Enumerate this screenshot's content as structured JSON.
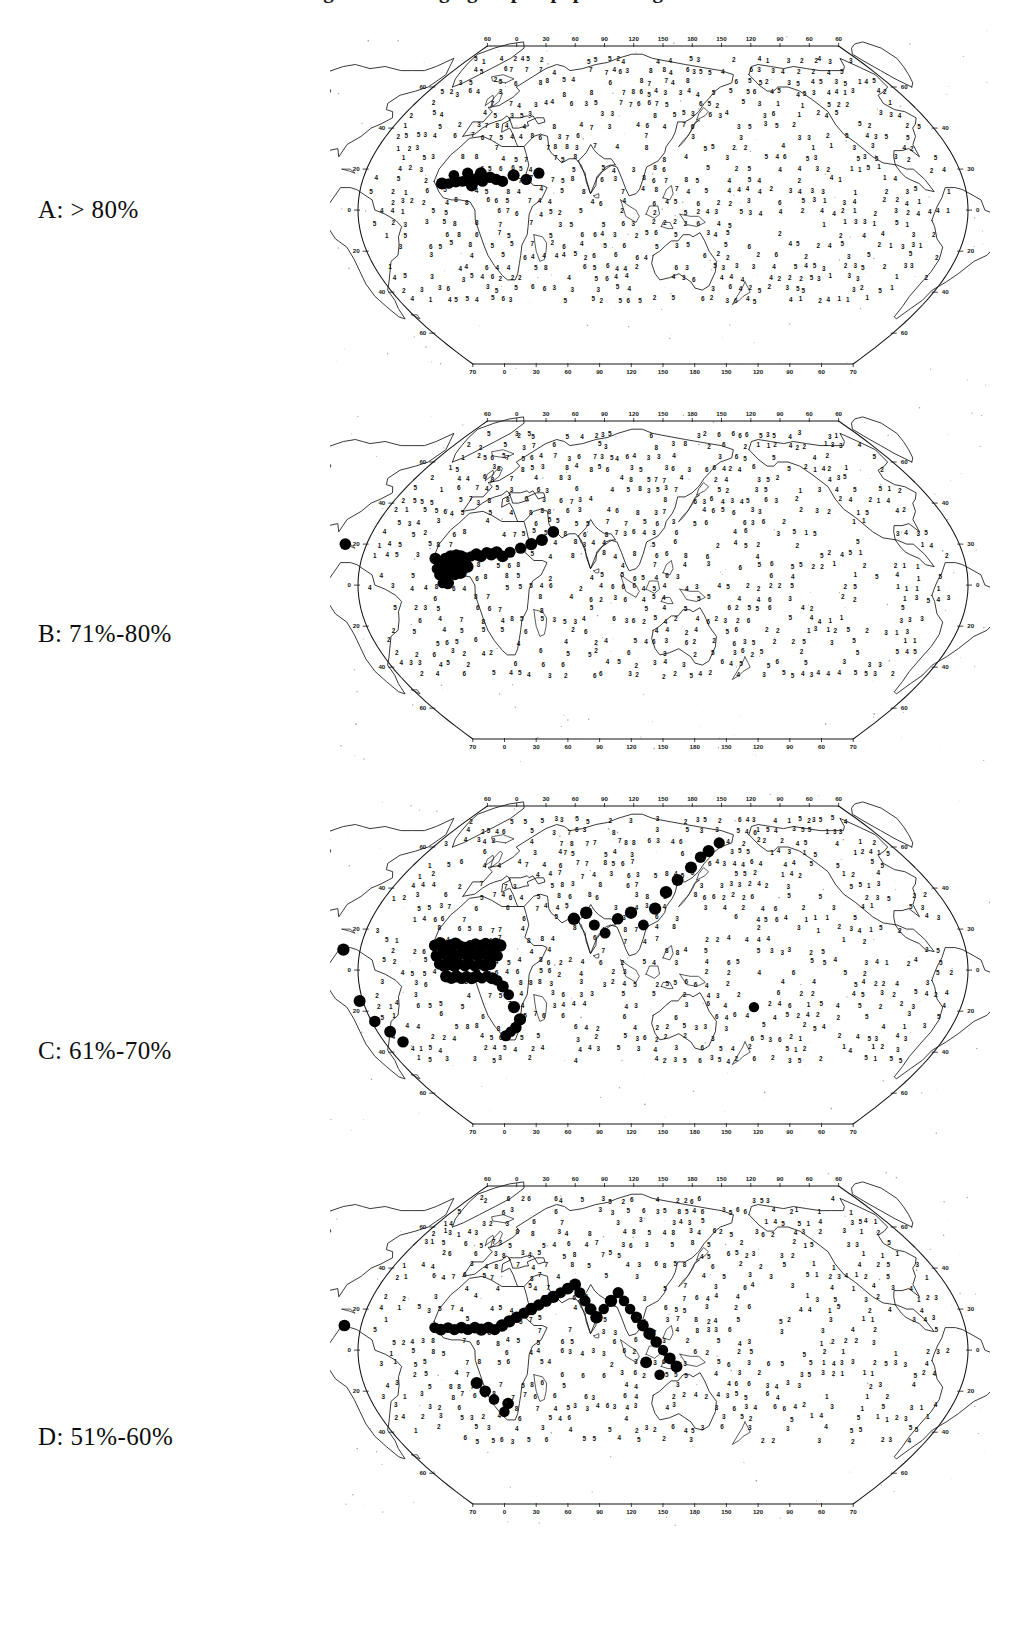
{
  "figure": {
    "title_cut_off": "Figure 1.  Changing map of population growth",
    "title_note": "top line clipped by page edge",
    "background_color": "#ffffff",
    "ink_color": "#111111",
    "marker_color": "#000000"
  },
  "panels": [
    {
      "id": "A",
      "label": "A:  > 80%",
      "letter": "A",
      "range_text": "> 80%",
      "label_y": 213,
      "map_top": 30
    },
    {
      "id": "B",
      "label": "B:  71%-80%",
      "letter": "B",
      "range_text": "71%-80%",
      "label_y": 637,
      "map_top": 405
    },
    {
      "id": "C",
      "label": "C: 61%-70%",
      "letter": "C",
      "range_text": "61%-70%",
      "label_y": 1054,
      "map_top": 790
    },
    {
      "id": "D",
      "label": "D:  51%-60%",
      "letter": "D",
      "range_text": "51%-60%",
      "label_y": 1440,
      "map_top": 1170
    }
  ],
  "chart_data": {
    "type": "map",
    "projection": "elliptical world projection (Robinson-like), centred near 60E",
    "panel_count": 4,
    "classes": [
      {
        "id": "A",
        "label": "A:  > 80%",
        "range": "> 80%",
        "min": 80,
        "max": null
      },
      {
        "id": "B",
        "label": "B:  71%-80%",
        "range": "71%-80%",
        "min": 71,
        "max": 80
      },
      {
        "id": "C",
        "label": "C: 61%-70%",
        "range": "61%-70%",
        "min": 61,
        "max": 70
      },
      {
        "id": "D",
        "label": "D:  51%-60%",
        "range": "51%-60%",
        "min": 51,
        "max": 60
      }
    ],
    "axes": {
      "top_longitude_ticks": [
        "60",
        "0",
        "30",
        "60",
        "90",
        "120",
        "150",
        "180",
        "150",
        "120",
        "90",
        "60",
        "60"
      ],
      "bottom_longitude_ticks": [
        "70",
        "0",
        "30",
        "60",
        "90",
        "120",
        "150",
        "180",
        "150",
        "120",
        "90",
        "60",
        "70"
      ],
      "left_latitude_ticks": [
        "60",
        "40",
        "20",
        "0",
        "20",
        "40",
        "60"
      ],
      "right_latitude_ticks": [
        "60",
        "40",
        "30",
        "0",
        "20",
        "40",
        "60"
      ],
      "grid": false,
      "units": "degrees"
    },
    "symbols": {
      "digits": "single-digit grid values 1-9 printed over land and ocean cells",
      "filled_circles": "solid black dots mark the grid cells belonging to that panel's percentage class"
    },
    "marker_counts": {
      "A": 17,
      "B": 34,
      "C": 61,
      "D": 45
    },
    "marker_regions": {
      "A": [
        "North Africa",
        "Sahel",
        "West Africa",
        "Arabian Peninsula"
      ],
      "B": [
        "West Africa",
        "Sahel",
        "Central Africa",
        "North Africa",
        "Middle East",
        "Caribbean"
      ],
      "C": [
        "Sub-Saharan Africa",
        "Southern Africa",
        "South Asia",
        "Southeast Asia",
        "East Asia",
        "South America"
      ],
      "D": [
        "South Asia",
        "Southeast Asia",
        "East Asia",
        "Central Asia",
        "Southern Africa",
        "North America",
        "South America"
      ]
    }
  }
}
